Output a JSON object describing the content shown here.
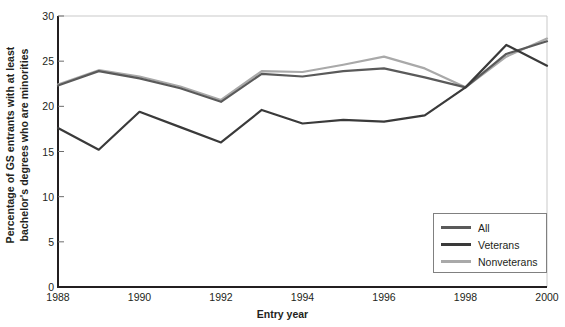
{
  "chart_data": {
    "type": "line",
    "title": "",
    "xlabel": "Entry year",
    "ylabel_line1": "Percentage of GS entrants with at least",
    "ylabel_line2": "bachelor's degrees who are minorities",
    "x": [
      1988,
      1989,
      1990,
      1991,
      1992,
      1993,
      1994,
      1995,
      1996,
      1997,
      1998,
      1999,
      2000
    ],
    "xtick_labels": [
      "1988",
      "1990",
      "1992",
      "1994",
      "1996",
      "1998",
      "2000"
    ],
    "xticks": [
      1988,
      1990,
      1992,
      1994,
      1996,
      1998,
      2000
    ],
    "xlim": [
      1988,
      2000
    ],
    "ytick_labels": [
      "0",
      "5",
      "10",
      "15",
      "20",
      "25",
      "30"
    ],
    "yticks": [
      0,
      5,
      10,
      15,
      20,
      25,
      30
    ],
    "ylim": [
      0,
      30
    ],
    "grid": false,
    "legend_position": "lower-right",
    "series": [
      {
        "name": "All",
        "color": "#5a5a5a",
        "values": [
          22.3,
          23.9,
          23.1,
          22.0,
          20.5,
          23.6,
          23.3,
          23.9,
          24.2,
          23.2,
          22.1,
          25.8,
          27.2
        ]
      },
      {
        "name": "Veterans",
        "color": "#3a3a3a",
        "values": [
          17.6,
          15.2,
          19.4,
          17.7,
          16.0,
          19.6,
          18.1,
          18.5,
          18.3,
          19.0,
          22.1,
          26.8,
          24.5
        ]
      },
      {
        "name": "Nonveterans",
        "color": "#a9a9a9",
        "values": [
          22.4,
          24.0,
          23.3,
          22.2,
          20.7,
          23.9,
          23.8,
          24.6,
          25.5,
          24.2,
          22.1,
          25.5,
          27.5
        ]
      }
    ]
  },
  "legend": {
    "items": [
      {
        "label": "All",
        "color": "#5a5a5a"
      },
      {
        "label": "Veterans",
        "color": "#3a3a3a"
      },
      {
        "label": "Nonveterans",
        "color": "#a9a9a9"
      }
    ]
  },
  "axes": {
    "x_title": "Entry year",
    "y_title_line1": "Percentage of GS entrants with at least",
    "y_title_line2": "bachelor's degrees who are minorities"
  }
}
